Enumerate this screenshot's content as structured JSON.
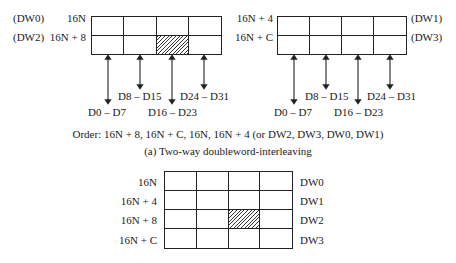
{
  "diagram_a": {
    "left_block": {
      "rows": [
        {
          "dw_label": "(DW0)",
          "address": "16N",
          "hatched_col": null
        },
        {
          "dw_label": "(DW2)",
          "address": "16N + 8",
          "hatched_col": 2
        }
      ],
      "columns": 4,
      "arrows": [
        {
          "label": "D0 – D7",
          "length": "long"
        },
        {
          "label": "D8 – D15",
          "length": "short"
        },
        {
          "label": "D16 – D23",
          "length": "long"
        },
        {
          "label": "D24 – D31",
          "length": "short"
        }
      ]
    },
    "right_block": {
      "rows": [
        {
          "address": "16N + 4",
          "dw_label": "(DW1)"
        },
        {
          "address": "16N + C",
          "dw_label": "(DW3)"
        }
      ],
      "columns": 4,
      "arrows": [
        {
          "label": "D0 – D7",
          "length": "long"
        },
        {
          "label": "D8 – D15",
          "length": "short"
        },
        {
          "label": "D16 – D23",
          "length": "long"
        },
        {
          "label": "D24 – D31",
          "length": "short"
        }
      ]
    },
    "order_text": "Order: 16N + 8, 16N + C, 16N, 16N + 4 (or DW2, DW3, DW0, DW1)",
    "caption": "(a) Two-way doubleword-interleaving"
  },
  "diagram_b": {
    "rows": [
      {
        "address": "16N",
        "dw_label": "DW0"
      },
      {
        "address": "16N + 4",
        "dw_label": "DW1"
      },
      {
        "address": "16N + 8",
        "dw_label": "DW2"
      },
      {
        "address": "16N + C",
        "dw_label": "DW3"
      }
    ],
    "columns": 4,
    "hatched": {
      "row": 2,
      "col": 2
    }
  },
  "colors": {
    "line": "#222222",
    "text": "#1a1a1a",
    "background": "#ffffff"
  }
}
